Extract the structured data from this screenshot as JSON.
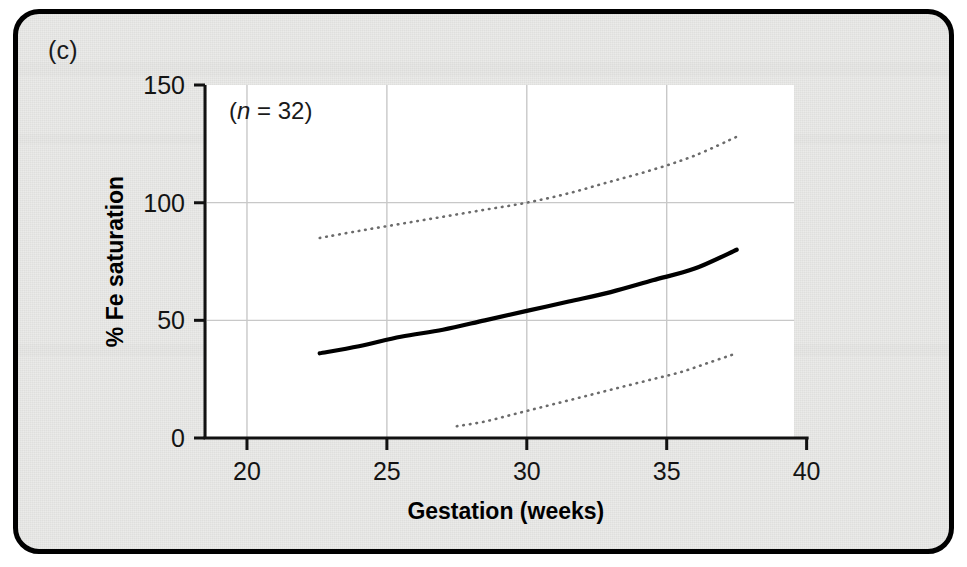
{
  "figure": {
    "panel_label": "(c)",
    "background_color": "#e9e9e7",
    "frame_color": "#000000",
    "plot_background_color": "#ffffff",
    "gridline_color": "#c8c8c8"
  },
  "annotation": {
    "prefix": "(",
    "symbol": "n",
    "equals": " = ",
    "value": "32",
    "suffix": ")",
    "full_text": "(n = 32)"
  },
  "chart_data": {
    "type": "line",
    "title": "",
    "subtitle": "",
    "xlabel": "Gestation (weeks)",
    "ylabel": "% Fe saturation",
    "xlim": [
      18.5,
      40.8
    ],
    "ylim": [
      0,
      150
    ],
    "xticks": [
      20,
      25,
      30,
      35,
      40
    ],
    "yticks": [
      0,
      50,
      100,
      150
    ],
    "xtick_labels": [
      "20",
      "25",
      "30",
      "35",
      "40"
    ],
    "ytick_labels": [
      "0",
      "50",
      "100",
      "150"
    ],
    "grid": true,
    "grid_axis": "both",
    "legend": "none",
    "annotations": [
      "(n = 32)"
    ],
    "series": [
      {
        "name": "upper 95% limit",
        "style": "dotted",
        "color": "#6b6b6b",
        "x": [
          22.6,
          24.0,
          25.5,
          27.0,
          28.5,
          30.0,
          31.5,
          33.0,
          34.5,
          36.0,
          37.5
        ],
        "values": [
          85,
          88,
          91,
          94,
          97,
          100,
          104,
          109,
          114,
          120,
          128
        ]
      },
      {
        "name": "mean % Fe saturation",
        "style": "solid",
        "color": "#000000",
        "x": [
          22.6,
          24.0,
          25.5,
          27.0,
          28.5,
          30.0,
          31.5,
          33.0,
          34.5,
          36.0,
          37.5
        ],
        "values": [
          36,
          39,
          43,
          46,
          50,
          54,
          58,
          62,
          67,
          72,
          80
        ]
      },
      {
        "name": "lower 95% limit",
        "style": "dotted",
        "color": "#6b6b6b",
        "x": [
          27.5,
          28.5,
          29.5,
          30.5,
          31.5,
          32.5,
          33.5,
          34.5,
          35.5,
          36.5,
          37.5
        ],
        "values": [
          5,
          7,
          10,
          13,
          16,
          19,
          22,
          25,
          28,
          32,
          36
        ]
      }
    ]
  }
}
